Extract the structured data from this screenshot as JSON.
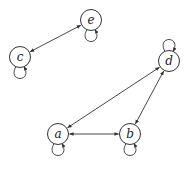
{
  "diagram": {
    "type": "directed-graph",
    "nodes": [
      {
        "id": "c",
        "label": "c",
        "x": 20,
        "y": 57,
        "loop": "below"
      },
      {
        "id": "e",
        "label": "e",
        "x": 91,
        "y": 20,
        "loop": "below"
      },
      {
        "id": "d",
        "label": "d",
        "x": 169,
        "y": 61,
        "loop": "above"
      },
      {
        "id": "a",
        "label": "a",
        "x": 58,
        "y": 134,
        "loop": "below"
      },
      {
        "id": "b",
        "label": "b",
        "x": 130,
        "y": 134,
        "loop": "below"
      }
    ],
    "edges": [
      {
        "from": "c",
        "to": "e",
        "bidirectional": true
      },
      {
        "from": "a",
        "to": "b",
        "bidirectional": true
      },
      {
        "from": "d",
        "to": "a",
        "bidirectional": true
      },
      {
        "from": "d",
        "to": "b",
        "bidirectional": true
      },
      {
        "from": "c",
        "to": "c",
        "self_loop": true
      },
      {
        "from": "e",
        "to": "e",
        "self_loop": true
      },
      {
        "from": "d",
        "to": "d",
        "self_loop": true
      },
      {
        "from": "a",
        "to": "a",
        "self_loop": true
      },
      {
        "from": "b",
        "to": "b",
        "self_loop": true
      }
    ],
    "colors": {
      "stroke": "#333333",
      "background": "#ffffff"
    }
  }
}
